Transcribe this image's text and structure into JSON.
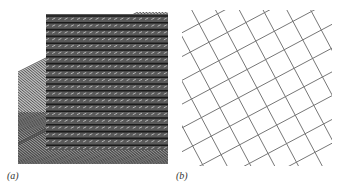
{
  "figure": {
    "panels": [
      {
        "id": "a",
        "label": "(a)",
        "description": "dense hatched lattice pattern"
      },
      {
        "id": "b",
        "label": "(b)",
        "description": "rotated square grid of lines"
      }
    ]
  }
}
